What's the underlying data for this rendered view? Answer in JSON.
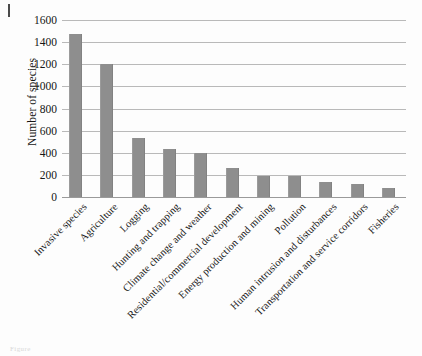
{
  "page": {
    "edge_mark": "page-edge-rule",
    "caption_remnant": "Figure"
  },
  "chart_data": {
    "type": "bar",
    "title": "",
    "subtitle": "",
    "xlabel": "",
    "ylabel": "Number of species",
    "ylim": [
      0,
      1600
    ],
    "ytick_step": 200,
    "yticks": [
      0,
      200,
      400,
      600,
      800,
      1000,
      1200,
      1400,
      1600
    ],
    "ytick_labels": [
      "0",
      "200",
      "400",
      "600",
      "800",
      "1000",
      "1200",
      "1400",
      "1600"
    ],
    "grid": true,
    "grid_axis": "y",
    "legend": false,
    "legend_position": "none",
    "bar_color": "#8e8e8e",
    "categories": [
      "Invasive species",
      "Agriculture",
      "Logging",
      "Hunting and trapping",
      "Climate change and weather",
      "Residential/commercial development",
      "Energy production and mining",
      "Pollution",
      "Human intrusion and disturbances",
      "Transportation and service corridors",
      "Fisheries"
    ],
    "values": [
      1470,
      1200,
      530,
      430,
      395,
      265,
      190,
      190,
      140,
      118,
      78
    ]
  },
  "colors": {
    "bar": "#8e8e8e",
    "gridline": "#b9b9b9",
    "axis": "#9a9a9a",
    "text": "#161616",
    "background": "#fdfdfd"
  }
}
